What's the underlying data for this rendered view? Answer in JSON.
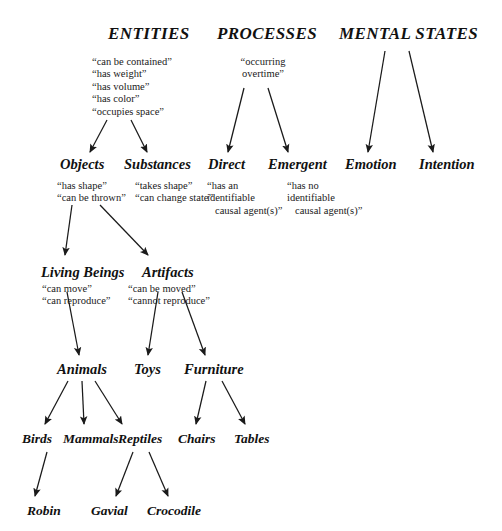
{
  "diagram": {
    "title_row": {
      "entities": "ENTITIES",
      "processes": "PROCESSES",
      "mental_states": "MENTAL STATES"
    },
    "attributes": {
      "entities": [
        "“can be contained”",
        "“has weight”",
        "“has volume”",
        "“has color”",
        "“occupies space”"
      ],
      "processes": [
        "“occurring",
        "overtime”"
      ],
      "objects": [
        "“has shape”",
        "“can be thrown”"
      ],
      "substances": [
        "“takes shape”",
        "“can change state”"
      ],
      "direct": [
        "“has an",
        "identifiable",
        "causal agent(s)”"
      ],
      "emergent": [
        "“has no",
        "identifiable",
        "causal agent(s)”"
      ],
      "living_beings": [
        "“can move”",
        "“can reproduce”"
      ],
      "artifacts": [
        "“can be moved”",
        "“cannot reproduce”"
      ]
    },
    "nodes": {
      "objects": "Objects",
      "substances": "Substances",
      "direct": "Direct",
      "emergent": "Emergent",
      "emotion": "Emotion",
      "intention": "Intention",
      "living_beings": "Living Beings",
      "artifacts": "Artifacts",
      "animals": "Animals",
      "toys": "Toys",
      "furniture": "Furniture",
      "birds": "Birds",
      "mammals": "Mammals",
      "reptiles": "Reptiles",
      "chairs": "Chairs",
      "tables": "Tables",
      "robin": "Robin",
      "gavial": "Gavial",
      "crocodile": "Crocodile"
    },
    "colors": {
      "background": "#ffffff",
      "text": "#111111",
      "edge": "#1a1a1a"
    }
  }
}
